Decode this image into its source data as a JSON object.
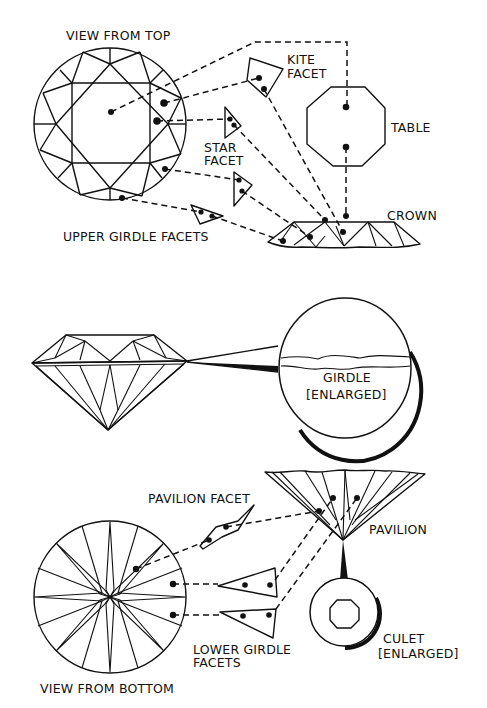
{
  "figure": {
    "colors": {
      "ink": "#111111",
      "paper": "#ffffff"
    }
  },
  "top_section": {
    "view_label": "VIEW FROM TOP",
    "labels": {
      "kite_line1": "KITE",
      "kite_line2": "FACET",
      "table": "TABLE",
      "star_line1": "STAR",
      "star_line2": "FACET",
      "crown": "CROWN",
      "upper_girdle": "UPPER GIRDLE FACETS"
    }
  },
  "middle_section": {
    "girdle_line1": "GIRDLE",
    "girdle_line2": "[ENLARGED]"
  },
  "bottom_section": {
    "view_label": "VIEW FROM BOTTOM",
    "labels": {
      "pavilion_facet": "PAVILION FACET",
      "pavilion": "PAVILION",
      "lower_girdle_line1": "LOWER GIRDLE",
      "lower_girdle_line2": "FACETS",
      "culet_line1": "CULET",
      "culet_line2": "[ENLARGED]"
    }
  }
}
